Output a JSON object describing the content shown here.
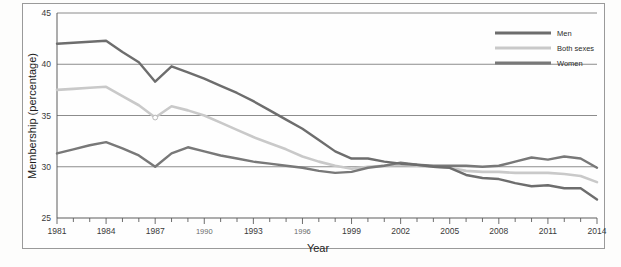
{
  "figure": {
    "title_fragment": "",
    "axis_x_label": "Year",
    "axis_y_label": "Membership (percentage)"
  },
  "legend": {
    "position": "top-right",
    "items": [
      {
        "label": "Men",
        "color": "#6d6d6d"
      },
      {
        "label": "Both sexes",
        "color": "#c9c9c9"
      },
      {
        "label": "Women",
        "color": "#787878"
      }
    ]
  },
  "axis": {
    "y_ticks": [
      "45",
      "40",
      "35",
      "30",
      "25"
    ],
    "x_ticks_labeled": [
      "1981",
      "1984",
      "1987",
      "1990",
      "1993",
      "1996",
      "1999",
      "2002",
      "2005",
      "2008",
      "2011",
      "2014"
    ]
  },
  "chart_data": {
    "type": "line",
    "title": "",
    "xlabel": "Year",
    "ylabel": "Membership (percentage)",
    "xlim": [
      1981,
      2014
    ],
    "ylim": [
      25,
      45
    ],
    "y_ticks": [
      25,
      30,
      35,
      40,
      45
    ],
    "x_ticks": [
      1981,
      1982,
      1983,
      1984,
      1985,
      1986,
      1987,
      1988,
      1989,
      1990,
      1991,
      1992,
      1993,
      1994,
      1995,
      1996,
      1997,
      1998,
      1999,
      2000,
      2001,
      2002,
      2003,
      2004,
      2005,
      2006,
      2007,
      2008,
      2009,
      2010,
      2011,
      2012,
      2013,
      2014
    ],
    "x_tick_labels_every": 3,
    "grid": true,
    "legend_position": "upper right",
    "x": [
      1981,
      1982,
      1983,
      1984,
      1985,
      1986,
      1987,
      1988,
      1989,
      1990,
      1991,
      1992,
      1993,
      1994,
      1995,
      1996,
      1997,
      1998,
      1999,
      2000,
      2001,
      2002,
      2003,
      2004,
      2005,
      2006,
      2007,
      2008,
      2009,
      2010,
      2011,
      2012,
      2013,
      2014
    ],
    "series": [
      {
        "name": "Men",
        "color": "#6d6d6d",
        "values": [
          42.0,
          42.1,
          42.2,
          42.3,
          41.2,
          40.2,
          38.3,
          39.8,
          39.2,
          38.6,
          37.9,
          37.2,
          36.4,
          35.5,
          34.6,
          33.7,
          32.6,
          31.5,
          30.8,
          30.8,
          30.5,
          30.3,
          30.2,
          30.0,
          29.9,
          29.2,
          28.9,
          28.8,
          28.4,
          28.1,
          28.2,
          27.9,
          27.9,
          26.8
        ]
      },
      {
        "name": "Both sexes",
        "color": "#c9c9c9",
        "values": [
          37.5,
          37.6,
          37.7,
          37.8,
          36.9,
          36.0,
          34.8,
          35.9,
          35.5,
          35.0,
          34.3,
          33.6,
          32.9,
          32.3,
          31.7,
          31.0,
          30.5,
          30.1,
          29.8,
          30.0,
          30.1,
          30.2,
          30.1,
          30.0,
          29.9,
          29.6,
          29.5,
          29.5,
          29.4,
          29.4,
          29.4,
          29.3,
          29.1,
          28.5
        ]
      },
      {
        "name": "Women",
        "color": "#787878",
        "values": [
          31.3,
          31.7,
          32.1,
          32.4,
          31.8,
          31.1,
          30.0,
          31.3,
          31.9,
          31.5,
          31.1,
          30.8,
          30.5,
          30.3,
          30.1,
          29.9,
          29.6,
          29.4,
          29.5,
          29.9,
          30.1,
          30.4,
          30.2,
          30.1,
          30.1,
          30.1,
          30.0,
          30.1,
          30.5,
          30.9,
          30.7,
          31.0,
          30.8,
          29.9
        ]
      }
    ]
  }
}
